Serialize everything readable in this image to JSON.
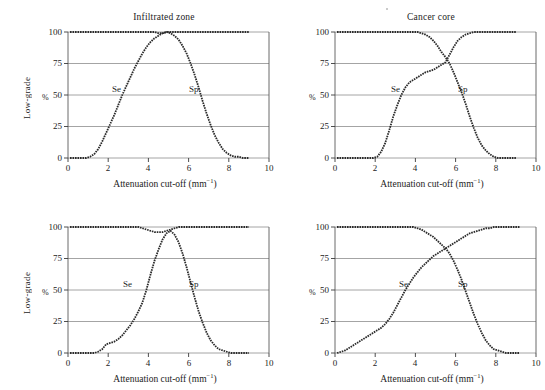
{
  "figure": {
    "background": "#ffffff",
    "ink": "#1c1c1c",
    "grid_color": "#8d8d8d",
    "curve_color": "#2b2b2b",
    "artifact_dot": "scan-speck"
  },
  "axis": {
    "xlabel_text": "Attenuation cut-off (mm",
    "xlabel_sup": "−1",
    "xlabel_tail": ")",
    "xlabel_full": "Attenuation cut-off (mm⁻¹)",
    "ylabel": "Low-grade",
    "yunit": "%",
    "xticks": [
      "0",
      "2",
      "4",
      "6",
      "8",
      "10"
    ],
    "yticks": [
      "0",
      "25",
      "50",
      "75",
      "100"
    ],
    "xlim": [
      0,
      10
    ],
    "ylim": [
      0,
      100
    ]
  },
  "series_labels": {
    "se": "Se",
    "sp": "Sp"
  },
  "chart_data": [
    {
      "id": "infiltrated-zone",
      "type": "line",
      "title": "Infiltrated zone",
      "xlabel": "Attenuation cut-off (mm⁻¹)",
      "ylabel": "Low-grade",
      "yunit": "%",
      "xlim": [
        0,
        10
      ],
      "ylim": [
        0,
        100
      ],
      "xticks": [
        0,
        2,
        4,
        6,
        8,
        10
      ],
      "yticks": [
        0,
        25,
        50,
        75,
        100
      ],
      "grid": "horizontal",
      "legend": "inline-annotation",
      "annotations": [
        {
          "text": "Se",
          "x": 2.55,
          "y": 57
        },
        {
          "text": "Sp",
          "x": 6.35,
          "y": 57
        }
      ],
      "x": [
        0.1,
        0.3,
        0.5,
        0.7,
        0.9,
        1.1,
        1.3,
        1.5,
        1.7,
        1.9,
        2.1,
        2.3,
        2.5,
        2.7,
        2.9,
        3.1,
        3.3,
        3.5,
        3.7,
        3.9,
        4.1,
        4.3,
        4.5,
        4.7,
        4.9,
        5.1,
        5.3,
        5.5,
        5.7,
        5.9,
        6.1,
        6.3,
        6.5,
        6.7,
        6.9,
        7.1,
        7.3,
        7.5,
        7.7,
        7.9,
        8.1,
        8.3,
        8.5,
        8.7,
        9.0
      ],
      "series": [
        {
          "name": "Se",
          "values": [
            0,
            0,
            0,
            0,
            0,
            1,
            3,
            7,
            13,
            20,
            27,
            34,
            42,
            50,
            57,
            64,
            71,
            77,
            83,
            88,
            92,
            95,
            97,
            99,
            100,
            99,
            97,
            94,
            89,
            83,
            75,
            66,
            56,
            45,
            35,
            26,
            18,
            12,
            7,
            4,
            2,
            1,
            1,
            0,
            0
          ]
        },
        {
          "name": "Sp",
          "values": [
            100,
            100,
            100,
            100,
            100,
            100,
            100,
            100,
            100,
            100,
            100,
            100,
            100,
            100,
            100,
            100,
            100,
            100,
            100,
            100,
            100,
            100,
            99,
            99,
            100,
            100,
            100,
            100,
            100,
            100,
            100,
            100,
            100,
            100,
            100,
            100,
            100,
            100,
            100,
            100,
            100,
            100,
            100,
            100,
            100
          ]
        }
      ]
    },
    {
      "id": "cancer-core",
      "type": "line",
      "title": "Cancer core",
      "xlabel": "Attenuation cut-off (mm⁻¹)",
      "ylabel": "",
      "yunit": "%",
      "xlim": [
        0,
        10
      ],
      "ylim": [
        0,
        100
      ],
      "xticks": [
        0,
        2,
        4,
        6,
        8,
        10
      ],
      "yticks": [
        0,
        25,
        50,
        75,
        100
      ],
      "grid": "horizontal",
      "legend": "inline-annotation",
      "annotations": [
        {
          "text": "Se",
          "x": 3.2,
          "y": 58
        },
        {
          "text": "Sp",
          "x": 6.5,
          "y": 58
        }
      ],
      "crossing": {
        "x": 5.6,
        "y": 75
      },
      "x": [
        0.1,
        0.3,
        0.5,
        0.7,
        0.9,
        1.1,
        1.3,
        1.5,
        1.7,
        1.9,
        2.1,
        2.3,
        2.5,
        2.7,
        2.9,
        3.1,
        3.3,
        3.5,
        3.7,
        3.9,
        4.1,
        4.3,
        4.5,
        4.7,
        4.9,
        5.1,
        5.3,
        5.5,
        5.7,
        5.9,
        6.1,
        6.3,
        6.5,
        6.7,
        6.9,
        7.1,
        7.3,
        7.5,
        7.7,
        7.9,
        8.1,
        8.3,
        8.5,
        8.7,
        9.0
      ],
      "series": [
        {
          "name": "Se",
          "values": [
            0,
            0,
            0,
            0,
            0,
            0,
            0,
            0,
            0,
            0,
            1,
            5,
            12,
            22,
            33,
            42,
            50,
            56,
            60,
            62,
            64,
            66,
            68,
            69,
            70,
            72,
            74,
            76,
            82,
            88,
            93,
            96,
            98,
            99,
            100,
            100,
            100,
            100,
            100,
            100,
            100,
            100,
            100,
            100,
            100
          ]
        },
        {
          "name": "Sp",
          "values": [
            100,
            100,
            100,
            100,
            100,
            100,
            100,
            100,
            100,
            100,
            100,
            100,
            100,
            100,
            100,
            100,
            100,
            100,
            100,
            100,
            100,
            99,
            98,
            96,
            93,
            89,
            84,
            80,
            75,
            68,
            60,
            52,
            43,
            33,
            24,
            16,
            10,
            6,
            3,
            1,
            0,
            0,
            0,
            0,
            0
          ]
        }
      ]
    },
    {
      "id": "panel-bottom-left",
      "type": "line",
      "title": "",
      "xlabel": "Attenuation cut-off (mm⁻¹)",
      "ylabel": "Low-grade",
      "yunit": "%",
      "xlim": [
        0,
        10
      ],
      "ylim": [
        0,
        100
      ],
      "xticks": [
        0,
        2,
        4,
        6,
        8,
        10
      ],
      "yticks": [
        0,
        25,
        50,
        75,
        100
      ],
      "grid": "horizontal",
      "legend": "inline-annotation",
      "annotations": [
        {
          "text": "Se",
          "x": 3.1,
          "y": 57
        },
        {
          "text": "Sp",
          "x": 6.35,
          "y": 57
        }
      ],
      "x": [
        0.1,
        0.3,
        0.5,
        0.7,
        0.9,
        1.1,
        1.3,
        1.5,
        1.7,
        1.9,
        2.1,
        2.3,
        2.5,
        2.7,
        2.9,
        3.1,
        3.3,
        3.5,
        3.7,
        3.9,
        4.1,
        4.3,
        4.5,
        4.7,
        4.9,
        5.1,
        5.3,
        5.5,
        5.7,
        5.9,
        6.1,
        6.3,
        6.5,
        6.7,
        6.9,
        7.1,
        7.3,
        7.5,
        7.7,
        7.9,
        8.1,
        8.3,
        8.5,
        8.7,
        9.0
      ],
      "series": [
        {
          "name": "Se",
          "values": [
            0,
            0,
            0,
            0,
            0,
            0,
            0,
            1,
            3,
            7,
            8,
            9,
            11,
            14,
            18,
            22,
            27,
            33,
            40,
            50,
            62,
            73,
            82,
            90,
            95,
            97,
            94,
            88,
            79,
            68,
            56,
            44,
            33,
            24,
            16,
            10,
            6,
            3,
            2,
            1,
            0,
            0,
            0,
            0,
            0
          ]
        },
        {
          "name": "Sp",
          "values": [
            100,
            100,
            100,
            100,
            100,
            100,
            100,
            100,
            100,
            100,
            100,
            100,
            100,
            100,
            100,
            100,
            100,
            100,
            99,
            98,
            97,
            96,
            96,
            96,
            97,
            98,
            99,
            100,
            100,
            100,
            100,
            100,
            100,
            100,
            100,
            100,
            100,
            100,
            100,
            100,
            100,
            100,
            100,
            100,
            100
          ]
        }
      ]
    },
    {
      "id": "panel-bottom-right",
      "type": "line",
      "title": "",
      "xlabel": "Attenuation cut-off (mm⁻¹)",
      "ylabel": "",
      "yunit": "%",
      "xlim": [
        0,
        10
      ],
      "ylim": [
        0,
        100
      ],
      "xticks": [
        0,
        2,
        4,
        6,
        8,
        10
      ],
      "yticks": [
        0,
        25,
        50,
        75,
        100
      ],
      "grid": "horizontal",
      "legend": "inline-annotation",
      "annotations": [
        {
          "text": "Se",
          "x": 3.5,
          "y": 57
        },
        {
          "text": "Sp",
          "x": 6.5,
          "y": 57
        }
      ],
      "crossing": {
        "x": 5.6,
        "y": 82
      },
      "x": [
        0.1,
        0.3,
        0.5,
        0.7,
        0.9,
        1.1,
        1.3,
        1.5,
        1.7,
        1.9,
        2.1,
        2.3,
        2.5,
        2.7,
        2.9,
        3.1,
        3.3,
        3.5,
        3.7,
        3.9,
        4.1,
        4.3,
        4.5,
        4.7,
        4.9,
        5.1,
        5.3,
        5.5,
        5.7,
        5.9,
        6.1,
        6.3,
        6.5,
        6.7,
        6.9,
        7.1,
        7.3,
        7.5,
        7.7,
        7.9,
        8.1,
        8.3,
        8.5,
        8.7,
        9.0,
        9.2
      ],
      "series": [
        {
          "name": "Se",
          "values": [
            0,
            1,
            2,
            4,
            6,
            8,
            10,
            12,
            14,
            16,
            18,
            20,
            23,
            27,
            32,
            38,
            44,
            50,
            55,
            60,
            64,
            68,
            71,
            74,
            77,
            79,
            81,
            83,
            85,
            87,
            89,
            91,
            93,
            95,
            96,
            97,
            98,
            99,
            99,
            100,
            100,
            100,
            100,
            100,
            100,
            100
          ]
        },
        {
          "name": "Sp",
          "values": [
            100,
            100,
            100,
            100,
            100,
            100,
            100,
            100,
            100,
            100,
            100,
            100,
            100,
            100,
            100,
            100,
            100,
            100,
            100,
            100,
            99,
            98,
            96,
            94,
            92,
            89,
            86,
            83,
            79,
            73,
            66,
            58,
            49,
            40,
            31,
            23,
            16,
            10,
            6,
            3,
            2,
            1,
            0,
            0,
            0,
            0
          ]
        }
      ]
    }
  ]
}
